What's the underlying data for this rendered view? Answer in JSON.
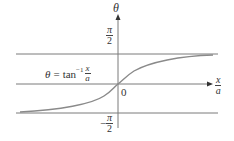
{
  "diagram": {
    "type": "function-graph",
    "function_label": {
      "lhs": "θ",
      "equals": "=",
      "func": "tan",
      "superscript": "−1",
      "arg_numerator": "x",
      "arg_denominator": "a"
    },
    "axes": {
      "y_axis_label": "θ",
      "x_axis_label_numerator": "x",
      "x_axis_label_denominator": "a",
      "origin_label": "0"
    },
    "asymptotes": [
      {
        "name": "upper",
        "value_label": {
          "sign": "",
          "numerator": "π",
          "denominator": "2"
        }
      },
      {
        "name": "lower",
        "value_label": {
          "sign": "−",
          "numerator": "π",
          "denominator": "2"
        }
      }
    ],
    "colors": {
      "curve": "#8a8a8a",
      "lines": "#7a7a7a",
      "text": "#333333"
    }
  }
}
